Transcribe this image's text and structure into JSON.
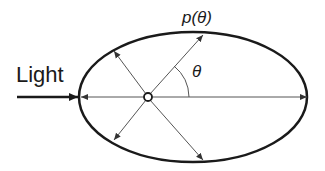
{
  "diagram": {
    "labels": {
      "light": "Light",
      "phase_function": "p(θ)",
      "angle": "θ"
    },
    "colors": {
      "stroke": "#1a1a1a",
      "thin_stroke": "#555555",
      "background": "#ffffff"
    },
    "shapes": {
      "ellipse": {
        "cx": 193,
        "cy": 97,
        "rx": 114,
        "ry": 65
      },
      "scatter_center": {
        "cx": 148,
        "cy": 97,
        "r": 4
      },
      "incident_arrow": {
        "x1": 17,
        "y1": 97,
        "x2": 78,
        "y2": 97
      },
      "scatter_arrows": [
        {
          "direction": "forward",
          "x2": 307,
          "y2": 97
        },
        {
          "direction": "backward",
          "x2": 81,
          "y2": 97
        },
        {
          "direction": "forward-up",
          "x2": 203,
          "y2": 35
        },
        {
          "direction": "backward-up",
          "x2": 114,
          "y2": 51
        },
        {
          "direction": "backward-down",
          "x2": 114,
          "y2": 140
        },
        {
          "direction": "forward-down",
          "x2": 203,
          "y2": 160
        }
      ]
    }
  }
}
